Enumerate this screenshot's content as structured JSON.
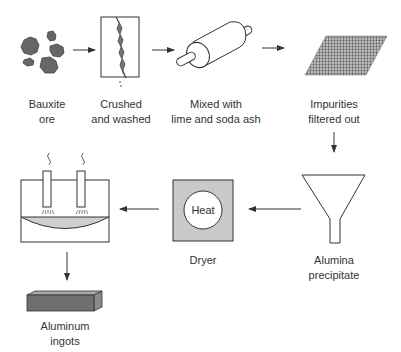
{
  "diagram": {
    "steps": [
      {
        "id": "bauxite",
        "line1": "Bauxite",
        "line2": "ore"
      },
      {
        "id": "crushed",
        "line1": "Crushed",
        "line2": "and washed"
      },
      {
        "id": "mixed",
        "line1": "Mixed with",
        "line2": "lime and soda ash"
      },
      {
        "id": "impurities",
        "line1": "Impurities",
        "line2": "filtered out"
      },
      {
        "id": "alumina",
        "line1": "Alumina",
        "line2": "precipitate"
      },
      {
        "id": "dryer",
        "line1": "Dryer",
        "line2": ""
      },
      {
        "id": "smelter",
        "line1": "",
        "line2": ""
      },
      {
        "id": "ingots",
        "line1": "Aluminum",
        "line2": "ingots"
      }
    ],
    "dryer_inner_label": "Heat",
    "colors": {
      "ink": "#333333",
      "fill_dark": "#6f6f6f",
      "fill_light": "#cfcfcf",
      "background": "#ffffff"
    }
  }
}
